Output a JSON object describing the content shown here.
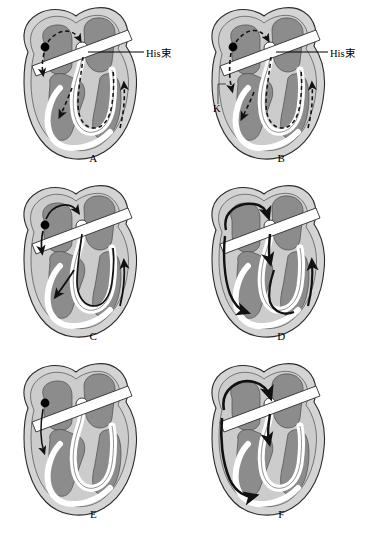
{
  "figure": {
    "panel_count": 6
  },
  "colors": {
    "background": "#ffffff",
    "myocardium": "#c9c9c9",
    "myocardium_light": "#d8d8d8",
    "chamber": "#8c8c8c",
    "chamber_dark": "#7a7a7a",
    "conduction_white": "#ffffff",
    "outline": "#2b2b2b",
    "arrow": "#111111",
    "focus_dot": "#000000",
    "text": "#000000"
  },
  "panels": [
    {
      "id": "A",
      "letter": "A",
      "label_his": "His束",
      "label_k": "",
      "arrow_style": "dashed",
      "description": "Dashed re-entrant circuit from left atrial focus through His bundle down septum and up right ventricular free wall"
    },
    {
      "id": "B",
      "letter": "B",
      "label_his": "His束",
      "label_k": "K",
      "arrow_style": "dashed",
      "description": "Dashed circuit with accessory pathway K marked on left lateral wall"
    },
    {
      "id": "C",
      "letter": "C",
      "label_his": "",
      "label_k": "",
      "arrow_style": "solid-thin",
      "description": "Solid arrows descending via His bundle with ventricular activation spreading to free walls"
    },
    {
      "id": "D",
      "letter": "D",
      "label_his": "",
      "label_k": "",
      "arrow_style": "solid-bold",
      "description": "Bold solid circuit looping through atrium, AV node and left ventricular wall"
    },
    {
      "id": "E",
      "letter": "E",
      "label_his": "",
      "label_k": "",
      "arrow_style": "solid-line",
      "description": "Single thin line from atrial focus descending the left lateral wall"
    },
    {
      "id": "F",
      "letter": "F",
      "label_his": "",
      "label_k": "",
      "arrow_style": "solid-bold",
      "description": "Bold solid macro re-entrant loop around left atrium and ventricle"
    }
  ]
}
